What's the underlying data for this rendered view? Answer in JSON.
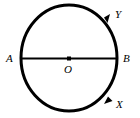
{
  "figure": {
    "name": "circle-with-diameter-and-orientation-arrows",
    "canvas": {
      "width": 140,
      "height": 118
    },
    "background_color": "#ffffff",
    "stroke_color": "#000000",
    "circle": {
      "center": {
        "x": 69,
        "y": 58
      },
      "radius_x": 48,
      "radius_y": 53,
      "stroke_width": 3
    },
    "diameter": {
      "from": {
        "x": 21,
        "y": 58
      },
      "to": {
        "x": 117,
        "y": 58
      },
      "stroke_width": 2
    },
    "center_point": {
      "x": 69,
      "y": 58,
      "size": 4
    },
    "labels": {
      "A": "A",
      "B": "B",
      "O": "O",
      "Y": "Y",
      "X": "X"
    },
    "arrows": [
      {
        "name": "arrow-y",
        "at": {
          "x": 107,
          "y": 19
        },
        "direction": "clockwise-upper-right"
      },
      {
        "name": "arrow-x",
        "at": {
          "x": 109,
          "y": 99
        },
        "direction": "counterclockwise-lower-right"
      }
    ]
  }
}
